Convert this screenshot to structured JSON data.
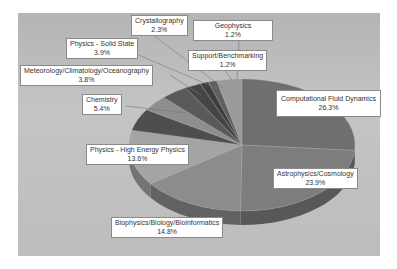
{
  "chart_data": {
    "type": "pie",
    "title": "",
    "style": "3d-pie",
    "legend": "none (data labels with leader lines)",
    "slices": [
      {
        "label": "Computational Fluid Dynamics",
        "value": 26.3,
        "display": "26.3%",
        "color": "#6f6f6f"
      },
      {
        "label": "Astrophysics/Cosmology",
        "value": 23.9,
        "display": "23.9%",
        "color": "#7d7d7d"
      },
      {
        "label": "Biophysics/Biology/Bioinformatics",
        "value": 14.8,
        "display": "14.8%",
        "color": "#8c8c8c"
      },
      {
        "label": "Physics - High Energy Physics",
        "value": 13.6,
        "display": "13.6%",
        "color": "#a4a4a4"
      },
      {
        "label": "Chemistry",
        "value": 5.4,
        "display": "5.4%",
        "color": "#4e4e4e"
      },
      {
        "label": "Meteorology/Climatology/Oceanography",
        "value": 3.8,
        "display": "3.8%",
        "color": "#8e8e8e"
      },
      {
        "label": "Physics - Solid State",
        "value": 3.9,
        "display": "3.9%",
        "color": "#5a5a5a"
      },
      {
        "label": "Crystallography",
        "value": 2.3,
        "display": "2.3%",
        "color": "#454545"
      },
      {
        "label": "Support/Benchmarking",
        "value": 1.2,
        "display": "1.2%",
        "color": "#3e3e3e"
      },
      {
        "label": "Geophysics",
        "value": 1.2,
        "display": "1.2%",
        "color": "#5f5f5f"
      },
      {
        "label": "",
        "value": 3.6,
        "display": "",
        "color": "#9a9a9a"
      }
    ]
  },
  "labels": {
    "cfd": {
      "name": "Computational Fluid Dynamics",
      "pct": "26.3%"
    },
    "astro": {
      "name": "Astrophysics/Cosmology",
      "pct": "23.9%"
    },
    "bio": {
      "name": "Biophysics/Biology/Bioinformatics",
      "pct": "14.8%"
    },
    "hep": {
      "name": "Physics - High Energy Physics",
      "pct": "13.6%"
    },
    "chem": {
      "name": "Chemistry",
      "pct": "5.4%"
    },
    "meteo": {
      "name": "Meteorology/Climatology/Oceanography",
      "pct": "3.8%"
    },
    "solid": {
      "name": "Physics - Solid State",
      "pct": "3.9%"
    },
    "crys": {
      "name": "Crystallography",
      "pct": "2.3%"
    },
    "support": {
      "name": "Support/Benchmarking",
      "pct": "1.2%"
    },
    "geo": {
      "name": "Geophysics",
      "pct": "1.2%"
    }
  }
}
